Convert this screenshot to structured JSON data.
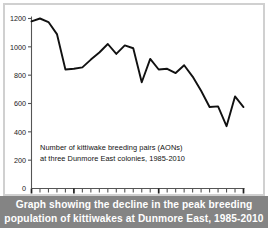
{
  "caption": {
    "line1": "Graph showing the decline in the peak breeding",
    "line2": "population of kittiwakes at Dunmore East, 1985-2010"
  },
  "annotation": {
    "line1": "Number of kittiwake breeding pairs (AONs)",
    "line2": "at three Dunmore East colonies, 1985-2010"
  },
  "style": {
    "line_color": "#111111",
    "axis_color": "#555555",
    "caption_bg": "#848484",
    "caption_fg": "#ffffff",
    "frame_color": "#d0d0d0",
    "background": "#ffffff"
  },
  "chart_data": {
    "type": "line",
    "title": "",
    "subtitle": "",
    "xlabel": "",
    "ylabel": "",
    "annotation": "Number of kittiwake breeding pairs (AONs) at three Dunmore East colonies, 1985-2010",
    "grid": false,
    "legend": false,
    "legend_position": "none",
    "xlim": [
      1985,
      2010
    ],
    "ylim": [
      0,
      1200
    ],
    "yticks": [
      0,
      200,
      400,
      600,
      800,
      1000,
      1200
    ],
    "ytick_labels": [
      "0",
      "200",
      "400",
      "600",
      "800",
      "1000",
      "1200"
    ],
    "xticks": [
      1985,
      1986,
      1987,
      1988,
      1989,
      1990,
      1991,
      1992,
      1993,
      1994,
      1995,
      1996,
      1997,
      1998,
      1999,
      2000,
      2001,
      2002,
      2003,
      2004,
      2005,
      2006,
      2007,
      2008,
      2009,
      2010
    ],
    "xtick_labels_shown": [
      "1985",
      "1990",
      "2000",
      "2010"
    ],
    "xtick_label_years": [
      1985,
      1990,
      2000,
      2010
    ],
    "series": [
      {
        "name": "Kittiwake breeding pairs (AONs)",
        "x": [
          1985,
          1986,
          1987,
          1988,
          1989,
          1990,
          1991,
          1992,
          1993,
          1994,
          1995,
          1996,
          1997,
          1998,
          1999,
          2000,
          2001,
          2002,
          2003,
          2004,
          2005,
          2006,
          2007,
          2008,
          2009,
          2010
        ],
        "values": [
          1180,
          1200,
          1175,
          1090,
          840,
          845,
          855,
          910,
          960,
          1020,
          950,
          1010,
          990,
          750,
          915,
          840,
          845,
          815,
          870,
          790,
          690,
          575,
          580,
          440,
          650,
          575
        ]
      }
    ]
  }
}
